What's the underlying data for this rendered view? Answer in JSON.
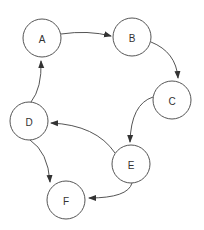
{
  "diagram": {
    "type": "directed-graph",
    "nodes": [
      {
        "id": "A",
        "label": "A",
        "cx": 42,
        "cy": 38,
        "r": 19
      },
      {
        "id": "B",
        "label": "B",
        "cx": 132,
        "cy": 37,
        "r": 19
      },
      {
        "id": "C",
        "label": "C",
        "cx": 172,
        "cy": 100,
        "r": 19
      },
      {
        "id": "D",
        "label": "D",
        "cx": 29,
        "cy": 121,
        "r": 19
      },
      {
        "id": "E",
        "label": "E",
        "cx": 131,
        "cy": 164,
        "r": 19
      },
      {
        "id": "F",
        "label": "F",
        "cx": 66,
        "cy": 200,
        "r": 19
      }
    ],
    "edges": [
      {
        "from": "A",
        "to": "B",
        "path": "M 61 34 Q 88 30 111 36"
      },
      {
        "from": "B",
        "to": "C",
        "path": "M 151 42 Q 176 52 178 78"
      },
      {
        "from": "C",
        "to": "E",
        "path": "M 153 97 Q 131 104 130 142"
      },
      {
        "from": "E",
        "to": "D",
        "path": "M 115 153 Q 96 125 51 123"
      },
      {
        "from": "D",
        "to": "A",
        "path": "M 31 102 Q 42 88 41 61"
      },
      {
        "from": "D",
        "to": "F",
        "path": "M 30 140 Q 48 152 50 182"
      },
      {
        "from": "E",
        "to": "F",
        "path": "M 132 183 Q 128 198 89 198"
      }
    ],
    "colors": {
      "stroke": "#555555",
      "fill": "#ffffff",
      "text": "#333333"
    }
  }
}
